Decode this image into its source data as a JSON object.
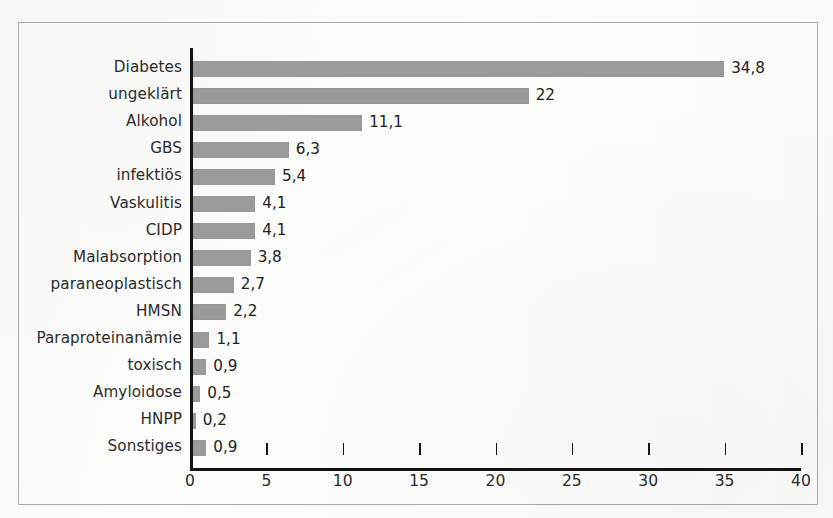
{
  "chart_data": {
    "type": "bar",
    "orientation": "horizontal",
    "title": "",
    "subtitle": "",
    "xlabel": "",
    "ylabel": "",
    "xlim": [
      0,
      40
    ],
    "ylim": null,
    "grid": false,
    "legend": null,
    "legend_position": "none",
    "decimal_separator": ",",
    "bar_color": "#9b9b9b",
    "axis_color": "#141414",
    "frame_color": "#a8a8a8",
    "background_color": "#fdfdfc",
    "text_color": "#2b2b2b",
    "categories": [
      "Diabetes",
      "ungeklärt",
      "Alkohol",
      "GBS",
      "infektiös",
      "Vaskulitis",
      "CIDP",
      "Malabsorption",
      "paraneoplastisch",
      "HMSN",
      "Paraproteinanämie",
      "toxisch",
      "Amyloidose",
      "HNPP",
      "Sonstiges"
    ],
    "values": [
      34.8,
      22,
      11.1,
      6.3,
      5.4,
      4.1,
      4.1,
      3.8,
      2.7,
      2.2,
      1.1,
      0.9,
      0.5,
      0.2,
      0.9
    ],
    "value_labels": [
      "34,8",
      "22",
      "11,1",
      "6,3",
      "5,4",
      "4,1",
      "4,1",
      "3,8",
      "2,7",
      "2,2",
      "1,1",
      "0,9",
      "0,5",
      "0,2",
      "0,9"
    ],
    "xticks": [
      0,
      5,
      10,
      15,
      20,
      25,
      30,
      35,
      40
    ],
    "xtick_labels": [
      "0",
      "5",
      "10",
      "15",
      "20",
      "25",
      "30",
      "35",
      "40"
    ]
  }
}
